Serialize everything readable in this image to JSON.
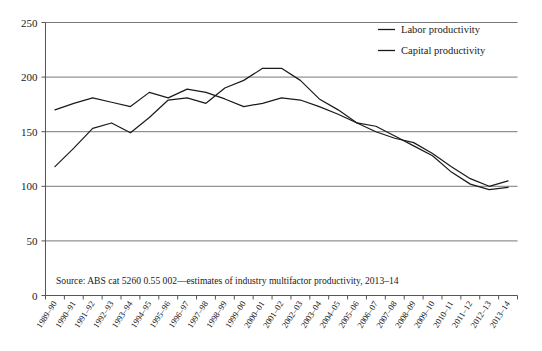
{
  "chart_data": {
    "type": "line",
    "title": "",
    "xlabel": "",
    "ylabel": "",
    "ylim": [
      0,
      250
    ],
    "yticks": [
      0,
      50,
      100,
      150,
      200,
      250
    ],
    "grid": true,
    "legend_position": "top-right",
    "categories": [
      "1989–90",
      "1990–91",
      "1991–92",
      "1992–93",
      "1993–94",
      "1994–95",
      "1995–96",
      "1996–97",
      "1997–98",
      "1998–99",
      "1999–00",
      "2000–01",
      "2001–02",
      "2002–03",
      "2003–04",
      "2004–05",
      "2005–06",
      "2006–07",
      "2007–08",
      "2008–09",
      "2009–10",
      "2010–11",
      "2011–12",
      "2012–13",
      "2013–14"
    ],
    "series": [
      {
        "name": "Labor productivity",
        "values": [
          170,
          176,
          181,
          177,
          173,
          186,
          181,
          189,
          186,
          180,
          173,
          176,
          181,
          179,
          173,
          166,
          158,
          150,
          144,
          140,
          130,
          118,
          107,
          100,
          105
        ]
      },
      {
        "name": "Capital productivity",
        "values": [
          118,
          135,
          153,
          158,
          149,
          163,
          179,
          181,
          176,
          190,
          197,
          208,
          208,
          197,
          180,
          170,
          158,
          155,
          146,
          137,
          128,
          113,
          102,
          97,
          99
        ]
      }
    ],
    "annotations": [
      "Source: ABS cat 5260 0.55 002—estimates of industry multifactor productivity, 2013–14"
    ]
  },
  "legend": {
    "items": [
      {
        "label": "Labor productivity"
      },
      {
        "label": "Capital productivity"
      }
    ]
  },
  "source": {
    "text": "Source: ABS cat 5260 0.55 002—estimates of industry multifactor productivity, 2013–14"
  }
}
